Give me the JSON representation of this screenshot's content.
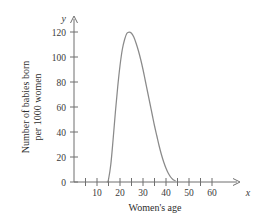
{
  "chart_data": {
    "type": "line",
    "title": "",
    "xlabel": "Women's age",
    "ylabel": "Number of babies born per 1000 women",
    "ylabel_line1": "Number of babies born",
    "ylabel_line2": "per 1000 women",
    "x_axis_variable": "x",
    "y_axis_variable": "y",
    "xlim": [
      0,
      65
    ],
    "ylim": [
      0,
      130
    ],
    "grid": false,
    "legend": false,
    "x_major_ticks": [
      10,
      20,
      30,
      40,
      50,
      60
    ],
    "x_minor_ticks": [
      5,
      15,
      25,
      35,
      45,
      55
    ],
    "x_tick_labels": [
      "10",
      "20",
      "30",
      "40",
      "50",
      "60"
    ],
    "y_major_ticks": [
      0,
      20,
      40,
      60,
      80,
      100,
      120
    ],
    "y_tick_labels": [
      "0",
      "20",
      "40",
      "60",
      "80",
      "100",
      "120"
    ],
    "series": [
      {
        "name": "Birth rate by age",
        "color": "#8a8a8a",
        "x": [
          14.5,
          15,
          16,
          17,
          18,
          19,
          20,
          21,
          22,
          23,
          24,
          25,
          26,
          27,
          28,
          29,
          30,
          31,
          32,
          33,
          34,
          35,
          36,
          37,
          38,
          39,
          40,
          41,
          42,
          43,
          44
        ],
        "values": [
          0,
          2,
          14,
          34,
          56,
          76,
          93,
          106,
          114,
          119,
          120,
          119,
          116,
          111,
          105,
          98,
          90,
          81,
          72,
          63,
          54,
          45,
          37,
          29,
          22,
          16,
          11,
          7,
          4,
          2,
          1
        ]
      }
    ],
    "annotations": {
      "peak_age": 24,
      "peak_value": 120,
      "onset_age": 15,
      "end_age": 44
    }
  },
  "colors": {
    "curve": "#8a8a8a",
    "axis": "#6f6f6f",
    "text": "#2e2e2e",
    "background": "#ffffff"
  }
}
